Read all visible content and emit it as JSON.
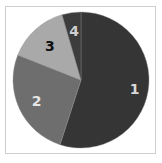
{
  "chart_data": {
    "type": "pie",
    "title": "",
    "start": "12 o'clock",
    "direction": "clockwise",
    "slices": [
      {
        "label": "1",
        "value": 55.0,
        "color": "#353535",
        "label_color": "#d9d9d9"
      },
      {
        "label": "2",
        "value": 26.0,
        "color": "#6e6e6e",
        "label_color": "#e6e6e6"
      },
      {
        "label": "3",
        "value": 14.5,
        "color": "#a9a9a9",
        "label_color": "#111111"
      },
      {
        "label": "4",
        "value": 4.5,
        "color": "#3c3c3c",
        "label_color": "#cfcfcf"
      }
    ],
    "legend": "none"
  }
}
